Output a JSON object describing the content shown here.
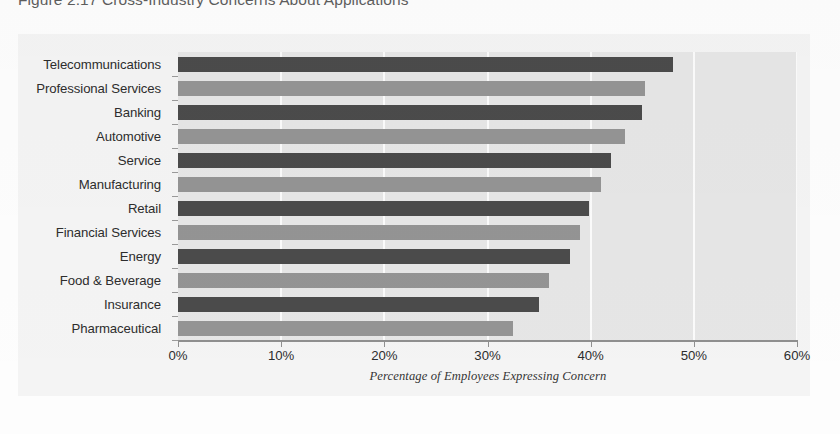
{
  "figure": {
    "caption": "Figure 2.17  Cross-Industry Concerns About Applications"
  },
  "chart_data": {
    "type": "bar",
    "orientation": "horizontal",
    "title": "",
    "xlabel": "Percentage of Employees Expressing Concern",
    "ylabel": "",
    "xlim": [
      0,
      60
    ],
    "xtick_values": [
      0,
      10,
      20,
      30,
      40,
      50,
      60
    ],
    "xtick_labels": [
      "0%",
      "10%",
      "20%",
      "30%",
      "40%",
      "50%",
      "60%"
    ],
    "grid": true,
    "grid_axis": "x",
    "legend": "none",
    "plot_background": "#e6e6e6",
    "bar_colors": {
      "dark": "#4b4b4b",
      "light": "#949494"
    },
    "categories": [
      "Telecommunications",
      "Professional Services",
      "Banking",
      "Automotive",
      "Service",
      "Manufacturing",
      "Retail",
      "Financial Services",
      "Energy",
      "Food & Beverage",
      "Insurance",
      "Pharmaceutical"
    ],
    "values": [
      48.0,
      45.3,
      45.0,
      43.3,
      42.0,
      41.0,
      39.8,
      39.0,
      38.0,
      36.0,
      35.0,
      32.5
    ],
    "value_labels": [
      "48%",
      "45%",
      "45%",
      "43%",
      "42%",
      "41%",
      "40%",
      "39%",
      "38%",
      "36%",
      "35%",
      "32%"
    ],
    "bar_shades": [
      "dark",
      "light",
      "dark",
      "light",
      "dark",
      "light",
      "dark",
      "light",
      "dark",
      "light",
      "dark",
      "light"
    ]
  }
}
